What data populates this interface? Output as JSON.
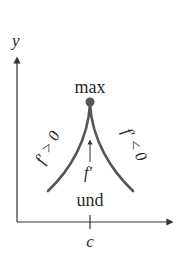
{
  "diagram": {
    "axes": {
      "y_label": "y",
      "x_tick_label": "c"
    },
    "point": {
      "label": "max"
    },
    "cusp": {
      "bottom_label": "und",
      "arrow_label": "f′"
    },
    "slopes": {
      "left_label": "f′ > 0",
      "right_label": "f′ < 0"
    },
    "colors": {
      "axis": "#333333",
      "curve": "#555555",
      "text": "#2a2a2a"
    }
  }
}
